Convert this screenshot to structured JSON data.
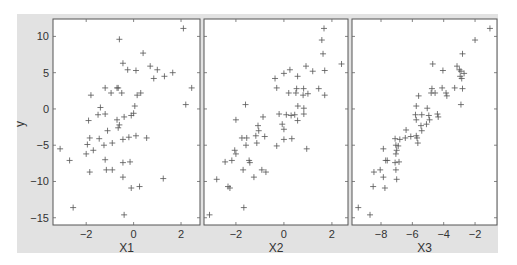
{
  "chart_data": [
    {
      "type": "scatter",
      "marker": "+",
      "xlabel": "X1",
      "ylabel": "y",
      "xlim": [
        -3.4,
        2.8
      ],
      "ylim": [
        -16,
        12.4
      ],
      "xticks": [
        -2,
        0,
        2
      ],
      "yticks": [
        10,
        5,
        0,
        -5,
        -10,
        -15
      ],
      "grid": false,
      "points": [
        [
          2.1,
          11.1
        ],
        [
          -0.6,
          9.6
        ],
        [
          0.4,
          7.7
        ],
        [
          -0.45,
          6.3
        ],
        [
          0.7,
          5.9
        ],
        [
          -0.25,
          5.4
        ],
        [
          0.1,
          5.3
        ],
        [
          1.0,
          5.4
        ],
        [
          1.65,
          5.0
        ],
        [
          1.3,
          4.5
        ],
        [
          0.85,
          4.2
        ],
        [
          2.45,
          2.9
        ],
        [
          -1.2,
          2.9
        ],
        [
          -0.7,
          2.9
        ],
        [
          -0.65,
          2.9
        ],
        [
          -0.95,
          2.2
        ],
        [
          -0.5,
          2.2
        ],
        [
          0.3,
          2.2
        ],
        [
          0.15,
          1.9
        ],
        [
          -1.8,
          1.9
        ],
        [
          2.2,
          0.6
        ],
        [
          -1.4,
          0.2
        ],
        [
          0.05,
          0.4
        ],
        [
          -1.5,
          -0.8
        ],
        [
          -1.2,
          -0.7
        ],
        [
          -0.4,
          -1.1
        ],
        [
          -0.1,
          -0.9
        ],
        [
          0.0,
          -0.6
        ],
        [
          -1.9,
          -1.6
        ],
        [
          -0.7,
          -1.5
        ],
        [
          -0.6,
          -2.2
        ],
        [
          -0.65,
          -2.6
        ],
        [
          -1.1,
          -3.0
        ],
        [
          -1.85,
          -4.0
        ],
        [
          -1.45,
          -4.1
        ],
        [
          -0.45,
          -4.2
        ],
        [
          -0.2,
          -3.9
        ],
        [
          0.1,
          -3.7
        ],
        [
          0.55,
          -4.0
        ],
        [
          -1.95,
          -4.9
        ],
        [
          -1.25,
          -5.0
        ],
        [
          -0.9,
          -4.7
        ],
        [
          -3.1,
          -5.5
        ],
        [
          -1.7,
          -5.7
        ],
        [
          -2.0,
          -6.2
        ],
        [
          -2.7,
          -7.1
        ],
        [
          -1.2,
          -7.0
        ],
        [
          -0.45,
          -7.4
        ],
        [
          -0.15,
          -7.3
        ],
        [
          -1.85,
          -8.7
        ],
        [
          -1.15,
          -8.4
        ],
        [
          -0.9,
          -8.4
        ],
        [
          -0.45,
          -9.4
        ],
        [
          1.25,
          -9.6
        ],
        [
          -0.1,
          -10.9
        ],
        [
          0.25,
          -10.7
        ],
        [
          -2.55,
          -13.6
        ],
        [
          -0.4,
          -14.6
        ]
      ]
    },
    {
      "type": "scatter",
      "marker": "+",
      "xlabel": "X2",
      "ylabel": "",
      "xlim": [
        -3.33,
        2.67
      ],
      "ylim": [
        -16,
        12.4
      ],
      "xticks": [
        -2,
        0,
        2
      ],
      "yticks": [
        10,
        5,
        0,
        -5,
        -10,
        -15
      ],
      "grid": false,
      "points": [
        [
          1.67,
          11.1
        ],
        [
          1.58,
          9.5
        ],
        [
          1.63,
          7.6
        ],
        [
          2.4,
          6.2
        ],
        [
          0.92,
          5.9
        ],
        [
          1.2,
          5.2
        ],
        [
          1.7,
          5.3
        ],
        [
          0.25,
          5.4
        ],
        [
          0.0,
          4.9
        ],
        [
          -0.37,
          4.2
        ],
        [
          0.57,
          4.5
        ],
        [
          -0.3,
          2.9
        ],
        [
          0.53,
          2.8
        ],
        [
          0.82,
          2.8
        ],
        [
          1.45,
          2.8
        ],
        [
          0.2,
          2.2
        ],
        [
          0.5,
          2.2
        ],
        [
          0.8,
          1.9
        ],
        [
          1.0,
          2.1
        ],
        [
          1.7,
          1.9
        ],
        [
          -1.6,
          0.6
        ],
        [
          0.58,
          0.4
        ],
        [
          0.83,
          0.1
        ],
        [
          -0.2,
          -0.7
        ],
        [
          0.1,
          -0.8
        ],
        [
          0.3,
          -0.9
        ],
        [
          0.45,
          -0.8
        ],
        [
          0.83,
          -0.7
        ],
        [
          -0.87,
          -1.1
        ],
        [
          -2.0,
          -1.5
        ],
        [
          0.57,
          -1.6
        ],
        [
          -0.07,
          -2.1
        ],
        [
          -1.08,
          -2.3
        ],
        [
          0.0,
          -2.8
        ],
        [
          -1.05,
          -3.0
        ],
        [
          -1.17,
          -3.7
        ],
        [
          -0.8,
          -3.8
        ],
        [
          -1.75,
          -4.0
        ],
        [
          -1.55,
          -4.0
        ],
        [
          0.33,
          -4.1
        ],
        [
          0.0,
          -4.2
        ],
        [
          -1.13,
          -4.7
        ],
        [
          -1.58,
          -5.0
        ],
        [
          -0.3,
          -5.1
        ],
        [
          0.95,
          -5.5
        ],
        [
          -2.05,
          -5.7
        ],
        [
          -2.0,
          -6.2
        ],
        [
          -2.17,
          -7.1
        ],
        [
          -2.45,
          -7.3
        ],
        [
          -1.45,
          -7.1
        ],
        [
          -1.42,
          -7.4
        ],
        [
          -1.7,
          -8.4
        ],
        [
          -0.92,
          -8.4
        ],
        [
          -0.75,
          -8.7
        ],
        [
          -1.25,
          -9.4
        ],
        [
          -2.8,
          -9.7
        ],
        [
          -2.33,
          -10.7
        ],
        [
          -2.25,
          -10.9
        ],
        [
          -1.67,
          -13.6
        ],
        [
          -3.1,
          -14.6
        ]
      ]
    },
    {
      "type": "scatter",
      "marker": "+",
      "xlabel": "X3",
      "ylabel": "",
      "xlim": [
        -9.85,
        -0.6
      ],
      "ylim": [
        -16,
        12.4
      ],
      "xticks": [
        -8,
        -6,
        -4,
        -2
      ],
      "yticks": [
        10,
        5,
        0,
        -5,
        -10,
        -15
      ],
      "grid": false,
      "points": [
        [
          -1.05,
          11.1
        ],
        [
          -2.0,
          9.5
        ],
        [
          -2.8,
          7.6
        ],
        [
          -4.7,
          6.2
        ],
        [
          -4.05,
          5.3
        ],
        [
          -3.15,
          5.9
        ],
        [
          -3.0,
          5.4
        ],
        [
          -2.9,
          5.2
        ],
        [
          -2.7,
          4.9
        ],
        [
          -2.85,
          4.2
        ],
        [
          -2.95,
          4.5
        ],
        [
          -4.75,
          2.8
        ],
        [
          -4.1,
          2.9
        ],
        [
          -3.3,
          2.9
        ],
        [
          -2.8,
          2.8
        ],
        [
          -4.8,
          2.2
        ],
        [
          -4.55,
          2.2
        ],
        [
          -3.85,
          2.2
        ],
        [
          -3.8,
          1.8
        ],
        [
          -5.6,
          1.8
        ],
        [
          -2.9,
          0.6
        ],
        [
          -5.75,
          0.4
        ],
        [
          -5.05,
          0.1
        ],
        [
          -4.4,
          -0.7
        ],
        [
          -5.8,
          -0.8
        ],
        [
          -5.4,
          -0.8
        ],
        [
          -4.95,
          -0.9
        ],
        [
          -4.35,
          -1.1
        ],
        [
          -5.75,
          -1.5
        ],
        [
          -4.9,
          -1.5
        ],
        [
          -5.1,
          -2.1
        ],
        [
          -5.45,
          -2.3
        ],
        [
          -6.4,
          -2.9
        ],
        [
          -5.4,
          -3.0
        ],
        [
          -7.1,
          -4.1
        ],
        [
          -6.8,
          -4.2
        ],
        [
          -6.45,
          -4.0
        ],
        [
          -6.1,
          -3.8
        ],
        [
          -5.75,
          -3.7
        ],
        [
          -5.7,
          -4.0
        ],
        [
          -5.65,
          -4.7
        ],
        [
          -7.05,
          -5.0
        ],
        [
          -6.9,
          -5.1
        ],
        [
          -7.85,
          -5.5
        ],
        [
          -7.0,
          -5.7
        ],
        [
          -7.05,
          -6.2
        ],
        [
          -7.7,
          -7.1
        ],
        [
          -7.6,
          -7.1
        ],
        [
          -7.1,
          -7.4
        ],
        [
          -6.85,
          -7.3
        ],
        [
          -7.05,
          -8.4
        ],
        [
          -8.05,
          -8.4
        ],
        [
          -8.45,
          -8.7
        ],
        [
          -7.85,
          -9.4
        ],
        [
          -7.0,
          -9.7
        ],
        [
          -8.5,
          -10.7
        ],
        [
          -7.75,
          -10.9
        ],
        [
          -9.45,
          -13.6
        ],
        [
          -8.7,
          -14.6
        ]
      ]
    }
  ],
  "layout": {
    "frame": {
      "x": 17,
      "y": 14,
      "w": 481,
      "h": 239,
      "color": "#e2e2e2"
    },
    "panels": [
      {
        "x": 53,
        "y": 19,
        "w": 147,
        "h": 206
      },
      {
        "x": 204,
        "y": 19,
        "w": 144,
        "h": 206
      },
      {
        "x": 352,
        "y": 19,
        "w": 145,
        "h": 206
      }
    ],
    "marker_color": "#555555",
    "axis_color": "#555555"
  }
}
